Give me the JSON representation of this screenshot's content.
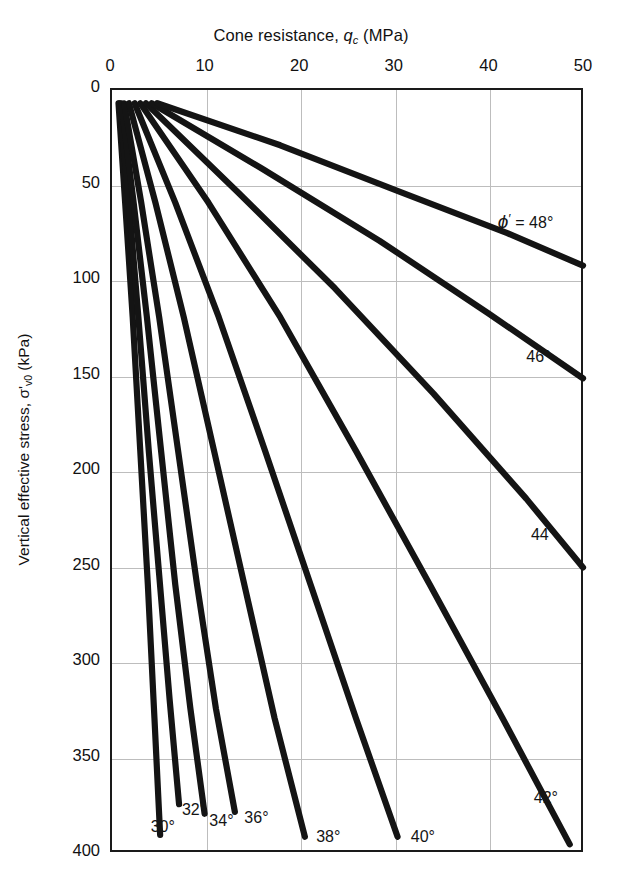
{
  "chart_data": {
    "type": "line",
    "title": "",
    "xlabel": "Cone resistance, qc (MPa)",
    "ylabel": "Vertical effective stress, σ'v0 (kPa)",
    "xlim": [
      0,
      50
    ],
    "ylim": [
      0,
      400
    ],
    "y_axis_inverted": true,
    "grid": true,
    "legend_position": "inline-curve-labels",
    "xticks": [
      0,
      10,
      20,
      30,
      40,
      50
    ],
    "yticks": [
      0,
      50,
      100,
      150,
      200,
      250,
      300,
      350,
      400
    ],
    "xtick_labels": [
      "0",
      "10",
      "20",
      "30",
      "40",
      "50"
    ],
    "ytick_labels": [
      "0",
      "50",
      "100",
      "150",
      "200",
      "250",
      "300",
      "350",
      "400"
    ],
    "series": [
      {
        "name": "30°",
        "label": "30°",
        "qc": [
          0.9,
          1.6,
          2.4,
          3.2,
          4.0,
          4.7,
          5.3
        ],
        "sigma": [
          8,
          60,
          120,
          190,
          260,
          330,
          391
        ]
      },
      {
        "name": "32°",
        "label": "32°",
        "qc": [
          1.0,
          2.0,
          3.0,
          4.1,
          5.2,
          6.3,
          7.3
        ],
        "sigma": [
          8,
          60,
          120,
          190,
          255,
          320,
          375
        ]
      },
      {
        "name": "34°",
        "label": "34°",
        "qc": [
          1.2,
          2.5,
          3.9,
          5.4,
          6.9,
          8.5,
          10.0
        ],
        "sigma": [
          8,
          60,
          120,
          190,
          260,
          325,
          380
        ]
      },
      {
        "name": "36°",
        "label": "36°",
        "qc": [
          1.5,
          3.3,
          5.2,
          7.2,
          9.2,
          11.2,
          13.2
        ],
        "sigma": [
          8,
          60,
          120,
          190,
          260,
          325,
          379
        ]
      },
      {
        "name": "38°",
        "label": "38°",
        "qc": [
          2.0,
          4.8,
          7.8,
          11.0,
          14.2,
          17.4,
          20.6
        ],
        "sigma": [
          8,
          60,
          120,
          190,
          260,
          330,
          392
        ]
      },
      {
        "name": "40°",
        "label": "40°",
        "qc": [
          2.6,
          6.9,
          11.5,
          16.4,
          21.2,
          26.0,
          30.4
        ],
        "sigma": [
          8,
          60,
          120,
          190,
          260,
          330,
          392
        ]
      },
      {
        "name": "42°",
        "label": "42°",
        "qc": [
          3.2,
          10.4,
          18.0,
          26.0,
          33.8,
          41.5,
          48.6
        ],
        "sigma": [
          8,
          60,
          120,
          190,
          260,
          330,
          396
        ]
      },
      {
        "name": "44°",
        "label": "44°",
        "qc": [
          3.8,
          13.6,
          23.8,
          34.2,
          44.0,
          50.0
        ],
        "sigma": [
          8,
          55,
          105,
          160,
          215,
          251
        ]
      },
      {
        "name": "46°",
        "label": "46°",
        "qc": [
          4.4,
          16.0,
          28.5,
          40.0,
          50.0
        ],
        "sigma": [
          8,
          42,
          80,
          118,
          152
        ]
      },
      {
        "name": "48°",
        "label": "48°",
        "qc": [
          5.0,
          18.0,
          31.0,
          42.0,
          50.0
        ],
        "sigma": [
          8,
          30,
          55,
          76,
          93
        ]
      }
    ],
    "annotations": [
      {
        "text": "ϕ' = 48°",
        "qc": 41.0,
        "sigma": 70
      },
      {
        "text": "46°",
        "qc": 44.0,
        "sigma": 142
      },
      {
        "text": "44°",
        "qc": 44.5,
        "sigma": 235
      },
      {
        "text": "42°",
        "qc": 44.8,
        "sigma": 373
      },
      {
        "text": "40°",
        "qc": 31.8,
        "sigma": 393
      },
      {
        "text": "38°",
        "qc": 21.8,
        "sigma": 393
      },
      {
        "text": "36°",
        "qc": 14.2,
        "sigma": 383
      },
      {
        "text": "34°",
        "qc": 10.5,
        "sigma": 385
      },
      {
        "text": "32°",
        "qc": 7.6,
        "sigma": 379
      },
      {
        "text": "30°",
        "qc": 4.3,
        "sigma": 388
      }
    ]
  },
  "axes": {
    "x_title_parts": {
      "main": "Cone resistance, ",
      "symbol": "q",
      "subscript": "c",
      "unit": " (MPa)"
    },
    "y_title_parts": {
      "main": "Vertical effective stress, ",
      "symbol": "σ'",
      "subscript": "v0",
      "unit": " (kPa)"
    }
  },
  "style": {
    "curve_color": "#141414",
    "frame_color": "#1a1a1a",
    "grid_color": "#bdbdbd",
    "background": "#ffffff",
    "text_color": "#111111"
  }
}
